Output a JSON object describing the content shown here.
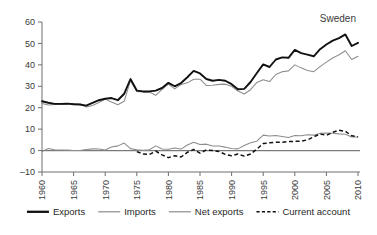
{
  "chart_data": {
    "type": "line",
    "title": "Sweden",
    "xlabel": "",
    "ylabel": "",
    "xlim": [
      1960,
      2010
    ],
    "ylim": [
      -10,
      60
    ],
    "grid": false,
    "legend_position": "bottom",
    "xticks": [
      "1960",
      "1965",
      "1970",
      "1975",
      "1980",
      "1985",
      "1990",
      "1995",
      "2000",
      "2005",
      "2010"
    ],
    "yticks": [
      "60",
      "50",
      "40",
      "30",
      "20",
      "10",
      "0",
      "-10"
    ],
    "x": [
      1960,
      1961,
      1962,
      1963,
      1964,
      1965,
      1966,
      1967,
      1968,
      1969,
      1970,
      1971,
      1972,
      1973,
      1974,
      1975,
      1976,
      1977,
      1978,
      1979,
      1980,
      1981,
      1982,
      1983,
      1984,
      1985,
      1986,
      1987,
      1988,
      1989,
      1990,
      1991,
      1992,
      1993,
      1994,
      1995,
      1996,
      1997,
      1998,
      1999,
      2000,
      2001,
      2002,
      2003,
      2004,
      2005,
      2006,
      2007,
      2008,
      2009,
      2010
    ],
    "series": [
      {
        "name": "Exports",
        "style": "solid-thick-black",
        "color": "#111111",
        "values": [
          23.0,
          22.3,
          21.8,
          21.8,
          21.9,
          21.6,
          21.5,
          21.0,
          22.3,
          23.5,
          24.2,
          24.5,
          23.5,
          26.5,
          33.4,
          28.0,
          27.6,
          27.6,
          28.0,
          29.2,
          31.6,
          30.0,
          31.5,
          34.2,
          37.2,
          36.0,
          33.4,
          32.6,
          33.0,
          32.6,
          31.0,
          28.6,
          28.8,
          32.0,
          36.2,
          40.2,
          39.0,
          42.5,
          43.5,
          43.3,
          47.0,
          45.5,
          44.8,
          44.0,
          47.3,
          49.5,
          51.3,
          52.5,
          54.2,
          48.8,
          50.3
        ]
      },
      {
        "name": "Imports",
        "style": "solid-thin-gray",
        "color": "#8d8d8d",
        "values": [
          22.0,
          21.3,
          21.5,
          21.5,
          21.8,
          22.0,
          21.7,
          20.3,
          21.0,
          22.4,
          24.0,
          22.7,
          21.4,
          23.0,
          32.6,
          27.6,
          27.4,
          27.3,
          25.8,
          28.6,
          31.0,
          28.8,
          30.8,
          31.6,
          33.3,
          33.3,
          30.4,
          30.5,
          30.9,
          31.0,
          30.0,
          27.8,
          26.4,
          28.4,
          31.8,
          33.0,
          32.2,
          35.5,
          36.8,
          37.2,
          40.0,
          38.6,
          37.4,
          36.8,
          39.2,
          41.3,
          43.2,
          44.7,
          46.6,
          42.5,
          44.0
        ]
      },
      {
        "name": "Net exports",
        "style": "solid-thin-gray",
        "color": "#8d8d8d",
        "values": [
          -0.4,
          1.0,
          0.4,
          0.3,
          0.2,
          0.0,
          0.0,
          0.5,
          0.8,
          0.7,
          0.3,
          1.7,
          2.2,
          3.5,
          0.9,
          0.4,
          0.1,
          0.4,
          2.2,
          0.7,
          0.6,
          1.2,
          0.7,
          2.6,
          3.9,
          2.8,
          3.0,
          2.1,
          2.1,
          1.6,
          1.0,
          0.8,
          2.4,
          3.6,
          4.4,
          7.2,
          6.8,
          7.0,
          6.6,
          6.1,
          7.0,
          6.9,
          7.4,
          7.2,
          8.1,
          8.2,
          8.1,
          7.8,
          7.6,
          6.3,
          6.3
        ]
      },
      {
        "name": "Current account",
        "style": "dashed-black",
        "color": "#111111",
        "start_year": 1975,
        "values": [
          null,
          null,
          null,
          null,
          null,
          null,
          null,
          null,
          null,
          null,
          null,
          null,
          null,
          null,
          null,
          -0.5,
          -1.6,
          -1.8,
          -0.3,
          -2.0,
          -3.3,
          -2.4,
          -3.0,
          -0.8,
          0.5,
          -1.2,
          0.3,
          0.0,
          -0.4,
          -1.8,
          -2.4,
          -1.6,
          -2.6,
          -1.6,
          0.7,
          3.3,
          3.6,
          3.9,
          3.9,
          4.2,
          4.3,
          4.4,
          5.0,
          6.4,
          7.8,
          7.1,
          8.5,
          9.5,
          9.0,
          6.9,
          6.4
        ]
      }
    ]
  },
  "legend": {
    "items": [
      {
        "label": "Exports",
        "swatch": "exports"
      },
      {
        "label": "Imports",
        "swatch": "imports"
      },
      {
        "label": "Net exports",
        "swatch": "net"
      },
      {
        "label": "Current account",
        "swatch": "ca"
      }
    ]
  }
}
